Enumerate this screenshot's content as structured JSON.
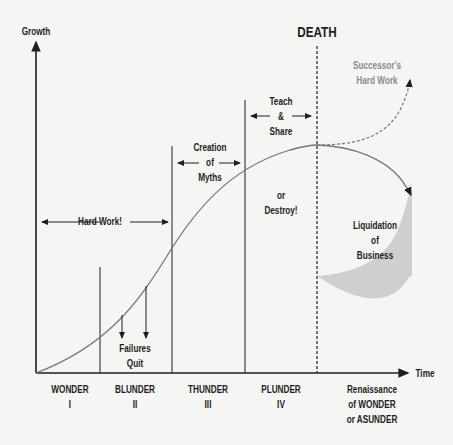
{
  "axes": {
    "y_label": "Growth",
    "x_label": "Time"
  },
  "markers": {
    "death": "DEATH"
  },
  "annotations": {
    "hard_work": "Hard Work!",
    "failures": [
      "Failures",
      "Quit"
    ],
    "creation_myths": [
      "Creation",
      "of",
      "Myths"
    ],
    "teach_share": [
      "Teach",
      "&",
      "Share"
    ],
    "destroy": [
      "or",
      "Destroy!"
    ],
    "successor": [
      "Successor's",
      "Hard Work"
    ],
    "liquidation": [
      "Liquidation",
      "of",
      "Business"
    ]
  },
  "stages": [
    {
      "name": "WONDER",
      "numeral": "I"
    },
    {
      "name": "BLUNDER",
      "numeral": "II"
    },
    {
      "name": "THUNDER",
      "numeral": "III"
    },
    {
      "name": "PLUNDER",
      "numeral": "IV"
    },
    {
      "name": "Renaissance",
      "line2": "of WONDER",
      "line3": "or ASUNDER"
    }
  ],
  "colors": {
    "ink": "#1e1e1e",
    "curve": "#777777",
    "fill": "#cfcfcf",
    "successor_text": "#8a8a8a"
  }
}
